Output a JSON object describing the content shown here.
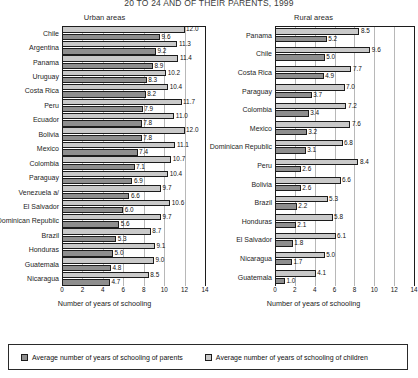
{
  "title": "20 TO 24 AND OF THEIR PARENTS, 1999",
  "legend": {
    "parents_label": "Average number of years of schooling of parents",
    "children_label": "Average number of years of schooling of children",
    "parents_color": "#8e8e8e",
    "children_color": "#c9c9c9"
  },
  "chart_data": [
    {
      "type": "bar",
      "title": "Urban areas",
      "orientation": "horizontal",
      "xlabel": "Number of years of schooling",
      "ylabel": "",
      "xlim": [
        0,
        14
      ],
      "xticks": [
        0,
        2,
        4,
        6,
        8,
        10,
        12,
        14
      ],
      "grid": true,
      "legend_position": "bottom",
      "categories": [
        "Chile",
        "Argentina",
        "Panama",
        "Uruguay",
        "Costa Rica",
        "Peru",
        "Ecuador",
        "Bolivia",
        "Mexico",
        "Colombia",
        "Paraguay",
        "Venezuela a/",
        "El Salvador",
        "Dominican Republic",
        "Brazil",
        "Honduras",
        "Guatemala",
        "Nicaragua"
      ],
      "series": [
        {
          "name": "Average number of years of schooling of children",
          "values": [
            12.0,
            11.3,
            11.4,
            10.2,
            10.4,
            11.7,
            11.0,
            12.0,
            11.1,
            10.7,
            10.4,
            9.7,
            10.6,
            9.7,
            8.7,
            9.1,
            9.0,
            8.5
          ]
        },
        {
          "name": "Average number of years of schooling of parents",
          "values": [
            9.6,
            9.2,
            8.9,
            8.3,
            8.2,
            7.9,
            7.8,
            7.8,
            7.4,
            7.1,
            6.9,
            6.6,
            6.0,
            5.6,
            5.3,
            5.0,
            4.8,
            4.7
          ]
        }
      ]
    },
    {
      "type": "bar",
      "title": "Rural areas",
      "orientation": "horizontal",
      "xlabel": "Number of years of schooling",
      "ylabel": "",
      "xlim": [
        0,
        14
      ],
      "xticks": [
        0,
        2,
        4,
        6,
        8,
        10,
        12,
        14
      ],
      "grid": true,
      "legend_position": "bottom",
      "categories": [
        "Panama",
        "Chile",
        "Costa Rica",
        "Paraguay",
        "Colombia",
        "Mexico",
        "Dominican Republic",
        "Peru",
        "Bolivia",
        "Brazil",
        "Honduras",
        "El Salvador",
        "Nicaragua",
        "Guatemala"
      ],
      "series": [
        {
          "name": "Average number of years of schooling of children",
          "values": [
            8.5,
            9.6,
            7.7,
            7.0,
            7.2,
            7.6,
            6.8,
            8.4,
            6.6,
            5.3,
            5.8,
            6.1,
            5.0,
            4.1
          ]
        },
        {
          "name": "Average number of years of schooling of parents",
          "values": [
            5.2,
            5.0,
            4.9,
            3.7,
            3.4,
            3.2,
            3.1,
            2.6,
            2.6,
            2.2,
            2.1,
            1.8,
            1.7,
            1.0
          ]
        }
      ]
    }
  ]
}
